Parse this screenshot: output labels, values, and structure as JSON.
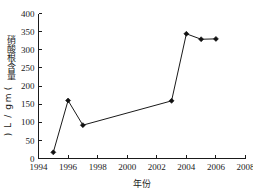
{
  "chart_data": {
    "type": "line",
    "title": "",
    "xlabel": "年份",
    "ylabel": "硝酸根含量(mg/L)",
    "xlim": [
      1994,
      2008
    ],
    "ylim": [
      0,
      400
    ],
    "xticks": [
      1994,
      1996,
      1998,
      2000,
      2002,
      2004,
      2006,
      2008
    ],
    "xtick_labels": [
      "1994",
      "1996",
      "1998",
      "2000",
      "2002",
      "2004",
      "2006",
      "2008"
    ],
    "yticks": [
      0,
      50,
      100,
      150,
      200,
      250,
      300,
      350,
      400
    ],
    "ytick_labels": [
      "0",
      "50",
      "100",
      "150",
      "200",
      "250",
      "300",
      "350",
      "400"
    ],
    "grid": false,
    "legend": false,
    "marker": "filled-diamond",
    "line_color": "#1a1a1a",
    "marker_color": "#111111",
    "background_color": "#ffffff",
    "x": [
      1995,
      1996,
      1997,
      2003,
      2004,
      2005,
      2006
    ],
    "values": [
      17,
      160,
      92,
      159,
      344,
      329,
      330
    ],
    "series": [
      {
        "name": "硝酸根含量",
        "points": [
          {
            "x": 1995,
            "y": 17
          },
          {
            "x": 1996,
            "y": 160
          },
          {
            "x": 1997,
            "y": 92
          },
          {
            "x": 2003,
            "y": 159
          },
          {
            "x": 2004,
            "y": 344
          },
          {
            "x": 2005,
            "y": 329
          },
          {
            "x": 2006,
            "y": 330
          }
        ]
      }
    ]
  }
}
